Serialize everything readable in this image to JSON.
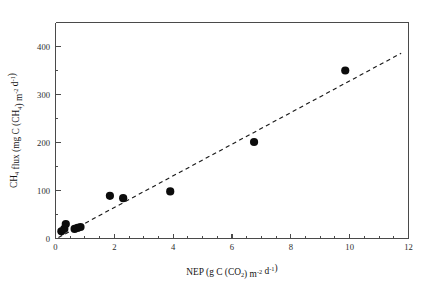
{
  "chart_data": {
    "type": "scatter",
    "title": "",
    "subtitle": "",
    "xlabel_plain": "NEP (g C (CO2) m-2 d-1)",
    "ylabel_plain": "CH4 flux (mg C (CH4) m-2 d-1)",
    "xlabel_parts": [
      {
        "t": "NEP (g C (CO",
        "k": "base"
      },
      {
        "t": "2",
        "k": "sub"
      },
      {
        "t": ") m",
        "k": "base"
      },
      {
        "t": "-2",
        "k": "sup"
      },
      {
        "t": " d",
        "k": "base"
      },
      {
        "t": "-1",
        "k": "sup"
      },
      {
        "t": ")",
        "k": "base"
      }
    ],
    "ylabel_parts": [
      {
        "t": "CH",
        "k": "base"
      },
      {
        "t": "4",
        "k": "sub"
      },
      {
        "t": " flux (mg C (CH",
        "k": "base"
      },
      {
        "t": "4",
        "k": "sub"
      },
      {
        "t": ") m",
        "k": "base"
      },
      {
        "t": "-2",
        "k": "sup"
      },
      {
        "t": " d",
        "k": "base"
      },
      {
        "t": "-1",
        "k": "sup"
      },
      {
        "t": ")",
        "k": "base"
      }
    ],
    "xlim": [
      0,
      12
    ],
    "ylim": [
      0,
      450
    ],
    "x_major_ticks": [
      0,
      2,
      4,
      6,
      8,
      10,
      12
    ],
    "x_major_tick_labels": [
      "0",
      "2",
      "4",
      "6",
      "8",
      "10",
      "12"
    ],
    "x_minor_tick_step": 0.5,
    "y_major_ticks": [
      0,
      100,
      200,
      300,
      400
    ],
    "y_major_tick_labels": [
      "0",
      "100",
      "200",
      "300",
      "400"
    ],
    "y_minor_tick_step": 50,
    "grid": false,
    "legend": false,
    "legend_position": "none",
    "marker": "filled-circle",
    "marker_color": "#0c0c0c",
    "points": [
      {
        "x": 0.2,
        "y": 15
      },
      {
        "x": 0.3,
        "y": 20
      },
      {
        "x": 0.35,
        "y": 30
      },
      {
        "x": 0.65,
        "y": 20
      },
      {
        "x": 0.75,
        "y": 22
      },
      {
        "x": 0.85,
        "y": 24
      },
      {
        "x": 1.85,
        "y": 89
      },
      {
        "x": 2.3,
        "y": 84
      },
      {
        "x": 3.9,
        "y": 98
      },
      {
        "x": 6.75,
        "y": 201
      },
      {
        "x": 9.85,
        "y": 350
      }
    ],
    "trendline": {
      "style": "dashed",
      "color": "#1a1a1a",
      "x_start": 0.1,
      "y_start": 2,
      "x_end": 11.75,
      "y_end": 386
    }
  }
}
